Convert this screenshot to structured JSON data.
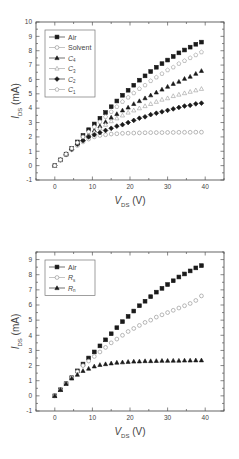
{
  "chart_data": [
    {
      "type": "scatter",
      "title": "",
      "xlabel": "V_DS (V)",
      "ylabel": "I_DS (mA)",
      "xlabel_main": "V",
      "xlabel_sub": "DS",
      "xlabel_unit": " (V)",
      "ylabel_main": "I",
      "ylabel_sub": "DS",
      "ylabel_unit": " (mA)",
      "xlim": [
        -5,
        45
      ],
      "ylim": [
        -1,
        10
      ],
      "xticks": [
        0,
        10,
        20,
        30,
        40
      ],
      "yticks": [
        -1,
        0,
        1,
        2,
        3,
        4,
        5,
        6,
        7,
        8,
        9,
        10
      ],
      "grid": false,
      "legend_position": "upper-left",
      "x": [
        0,
        1.5,
        3,
        4.5,
        6,
        7.5,
        9,
        10.5,
        12,
        13.5,
        15,
        16.5,
        18,
        19.5,
        21,
        22.5,
        24,
        25.5,
        27,
        28.5,
        30,
        31.5,
        33,
        34.5,
        36,
        37.5,
        39
      ],
      "series": [
        {
          "name": "Air",
          "label_main": "Air",
          "label_sub": "",
          "marker": "square-filled",
          "values": [
            0,
            0.4,
            0.8,
            1.2,
            1.65,
            2.1,
            2.5,
            2.9,
            3.3,
            3.7,
            4.1,
            4.5,
            4.9,
            5.25,
            5.6,
            5.95,
            6.25,
            6.55,
            6.85,
            7.1,
            7.35,
            7.6,
            7.85,
            8.05,
            8.25,
            8.45,
            8.6
          ]
        },
        {
          "name": "Solvent",
          "label_main": "Solvent",
          "label_sub": "",
          "marker": "circle-open",
          "values": [
            0,
            0.4,
            0.75,
            1.1,
            1.4,
            1.65,
            1.85,
            2.0,
            2.1,
            2.15,
            2.2,
            2.22,
            2.25,
            2.26,
            2.27,
            2.28,
            2.29,
            2.3,
            2.3,
            2.3,
            2.31,
            2.31,
            2.32,
            2.32,
            2.32,
            2.33,
            2.33
          ]
        },
        {
          "name": "C4",
          "label_main": "C",
          "label_sub": "4",
          "marker": "triangle-filled",
          "values": [
            0,
            0.4,
            0.8,
            1.2,
            1.55,
            1.85,
            2.15,
            2.45,
            2.75,
            3.05,
            3.35,
            3.6,
            3.85,
            4.05,
            4.3,
            4.5,
            4.7,
            4.9,
            5.1,
            5.3,
            5.5,
            5.7,
            5.85,
            6.05,
            6.2,
            6.4,
            6.6
          ]
        },
        {
          "name": "C3",
          "label_main": "C",
          "label_sub": "3",
          "marker": "triangle-open",
          "values": [
            0,
            0.4,
            0.8,
            1.15,
            1.5,
            1.8,
            2.1,
            2.35,
            2.6,
            2.85,
            3.1,
            3.3,
            3.5,
            3.7,
            3.85,
            4.0,
            4.15,
            4.3,
            4.45,
            4.6,
            4.7,
            4.85,
            4.95,
            5.05,
            5.15,
            5.25,
            5.35
          ]
        },
        {
          "name": "C2",
          "label_main": "C",
          "label_sub": "2",
          "marker": "diamond-filled",
          "values": [
            0,
            0.4,
            0.8,
            1.15,
            1.5,
            1.75,
            2.0,
            2.15,
            2.3,
            2.45,
            2.6,
            2.75,
            2.85,
            3.0,
            3.15,
            3.3,
            3.4,
            3.55,
            3.65,
            3.75,
            3.85,
            3.95,
            4.05,
            4.15,
            4.2,
            4.3,
            4.35
          ]
        },
        {
          "name": "C1",
          "label_main": "C",
          "label_sub": "1",
          "marker": "pentagon-open",
          "values": [
            0,
            0.4,
            0.8,
            1.2,
            1.6,
            2.0,
            2.35,
            2.7,
            3.05,
            3.4,
            3.75,
            4.1,
            4.45,
            4.75,
            5.05,
            5.35,
            5.6,
            5.9,
            6.15,
            6.4,
            6.65,
            6.85,
            7.1,
            7.3,
            7.5,
            7.7,
            7.9
          ]
        }
      ]
    },
    {
      "type": "scatter",
      "title": "",
      "xlabel": "V_DS (V)",
      "ylabel": "I_DS (mA)",
      "xlabel_main": "V",
      "xlabel_sub": "DS",
      "xlabel_unit": " (V)",
      "ylabel_main": "I",
      "ylabel_sub": "DS",
      "ylabel_unit": " (mA)",
      "xlim": [
        -5,
        45
      ],
      "ylim": [
        -1,
        9.5
      ],
      "xticks": [
        0,
        10,
        20,
        30,
        40
      ],
      "yticks": [
        -1,
        0,
        1,
        2,
        3,
        4,
        5,
        6,
        7,
        8,
        9
      ],
      "grid": false,
      "legend_position": "upper-left",
      "x": [
        0,
        1.5,
        3,
        4.5,
        6,
        7.5,
        9,
        10.5,
        12,
        13.5,
        15,
        16.5,
        18,
        19.5,
        21,
        22.5,
        24,
        25.5,
        27,
        28.5,
        30,
        31.5,
        33,
        34.5,
        36,
        37.5,
        39
      ],
      "series": [
        {
          "name": "Air",
          "label_main": "Air",
          "label_sub": "",
          "marker": "square-filled",
          "values": [
            0,
            0.4,
            0.8,
            1.2,
            1.65,
            2.1,
            2.5,
            2.9,
            3.3,
            3.7,
            4.1,
            4.5,
            4.9,
            5.25,
            5.6,
            5.95,
            6.25,
            6.55,
            6.85,
            7.1,
            7.35,
            7.6,
            7.85,
            8.05,
            8.25,
            8.45,
            8.6
          ]
        },
        {
          "name": "Rs",
          "label_main": "R",
          "label_sub": "s",
          "marker": "circle-open",
          "values": [
            0,
            0.4,
            0.8,
            1.2,
            1.6,
            2.0,
            2.3,
            2.6,
            2.9,
            3.2,
            3.5,
            3.75,
            4.0,
            4.25,
            4.45,
            4.65,
            4.85,
            5.0,
            5.2,
            5.35,
            5.5,
            5.65,
            5.8,
            5.95,
            6.1,
            6.3,
            6.6
          ]
        },
        {
          "name": "Rn",
          "label_main": "R",
          "label_sub": "n",
          "marker": "triangle-filled",
          "values": [
            0,
            0.4,
            0.8,
            1.15,
            1.4,
            1.65,
            1.8,
            1.95,
            2.05,
            2.1,
            2.15,
            2.2,
            2.22,
            2.25,
            2.27,
            2.28,
            2.3,
            2.3,
            2.31,
            2.32,
            2.32,
            2.33,
            2.33,
            2.34,
            2.34,
            2.35,
            2.35
          ]
        }
      ]
    }
  ]
}
